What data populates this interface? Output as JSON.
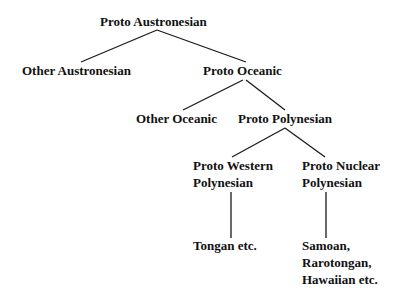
{
  "diagram": {
    "type": "tree",
    "line_color": "#1a1a1a",
    "nodes": {
      "proto_austronesian": {
        "label": "Proto Austronesian"
      },
      "other_austronesian": {
        "label": "Other Austronesian"
      },
      "proto_oceanic": {
        "label": "Proto Oceanic"
      },
      "other_oceanic": {
        "label": "Other Oceanic"
      },
      "proto_polynesian": {
        "label": "Proto Polynesian"
      },
      "proto_western_polynesian": {
        "lines": [
          "Proto Western",
          "Polynesian"
        ]
      },
      "proto_nuclear_polynesian": {
        "lines": [
          "Proto Nuclear",
          "Polynesian"
        ]
      },
      "tongan": {
        "label": "Tongan etc."
      },
      "samoan_group": {
        "lines": [
          "Samoan,",
          "Rarotongan,",
          "Hawaiian etc."
        ]
      }
    },
    "edges": [
      [
        "proto_austronesian",
        "other_austronesian"
      ],
      [
        "proto_austronesian",
        "proto_oceanic"
      ],
      [
        "proto_oceanic",
        "other_oceanic"
      ],
      [
        "proto_oceanic",
        "proto_polynesian"
      ],
      [
        "proto_polynesian",
        "proto_western_polynesian"
      ],
      [
        "proto_polynesian",
        "proto_nuclear_polynesian"
      ],
      [
        "proto_western_polynesian",
        "tongan"
      ],
      [
        "proto_nuclear_polynesian",
        "samoan_group"
      ]
    ]
  }
}
